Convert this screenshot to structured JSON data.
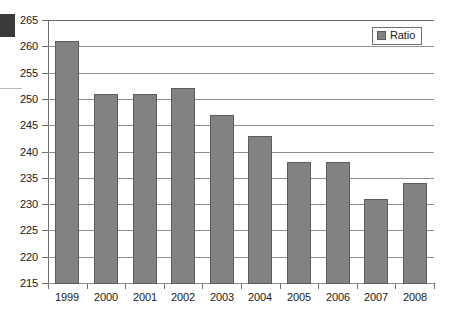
{
  "chart_data": {
    "type": "bar",
    "title": "",
    "xlabel": "",
    "ylabel": "",
    "categories": [
      "1999",
      "2000",
      "2001",
      "2002",
      "2003",
      "2004",
      "2005",
      "2006",
      "2007",
      "2008"
    ],
    "values": [
      261,
      251,
      251,
      252,
      247,
      243,
      238,
      238,
      231,
      234
    ],
    "series": [
      {
        "name": "Ratio",
        "values": [
          261,
          251,
          251,
          252,
          247,
          243,
          238,
          238,
          231,
          234
        ]
      }
    ],
    "ylim": [
      215,
      265
    ],
    "ytick_step": 5,
    "ytick_labels": [
      "265",
      "260",
      "255",
      "250",
      "245",
      "240",
      "235",
      "230",
      "225",
      "220",
      "215"
    ],
    "grid": true,
    "legend": {
      "position": "top-right",
      "entries": [
        {
          "label": "Ratio",
          "color": "#828282"
        }
      ]
    },
    "colors": {
      "bar_fill": "#828282",
      "bar_stroke": "#5c5c5c",
      "gridline": "#8e8e8e",
      "axis": "#6f6f6f",
      "text": "#1a1a1a",
      "background": "#ffffff"
    }
  },
  "artifacts": {
    "corner_block_color": "#3a3a3a",
    "edge_rule_color": "#b9b9b9"
  }
}
